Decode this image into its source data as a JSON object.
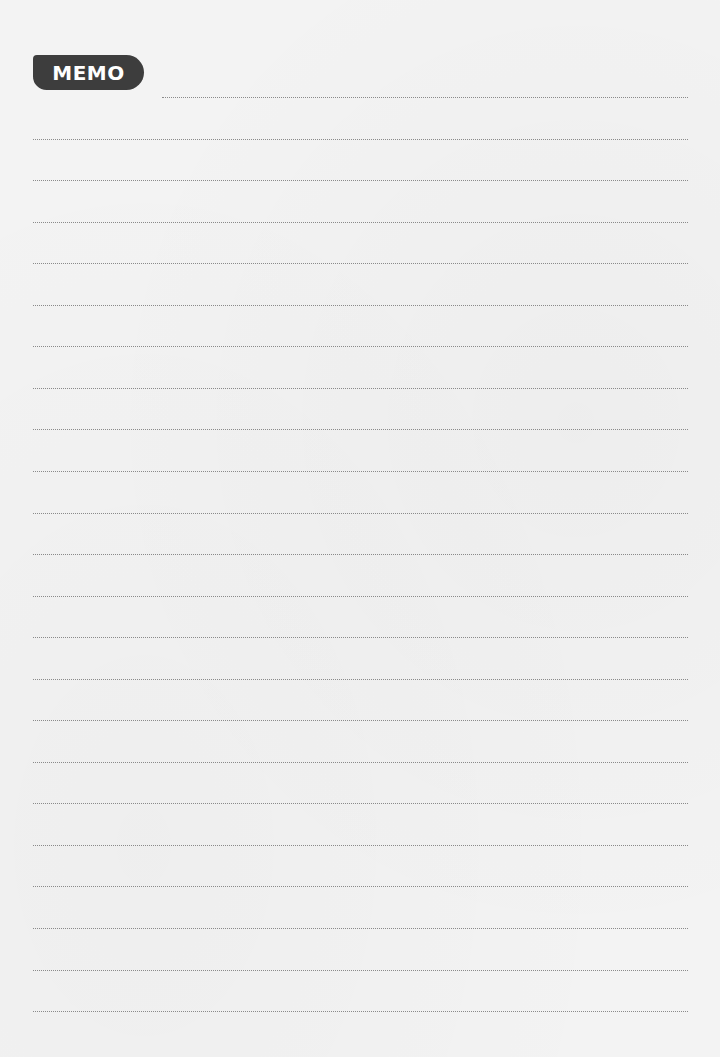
{
  "memo": {
    "title": "MEMO",
    "badge_color": "#3d3d3d",
    "badge_text_color": "#ffffff",
    "line_color": "#8a8a8a",
    "line_count": 23
  }
}
